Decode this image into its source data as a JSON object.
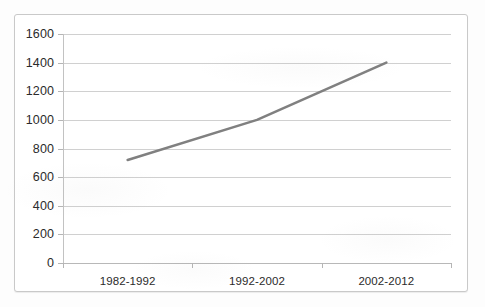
{
  "chart_data": {
    "type": "line",
    "title": "",
    "subtitle": "",
    "xlabel": "",
    "ylabel": "",
    "categories": [
      "1982-1992",
      "1992-2002",
      "2002-2012"
    ],
    "series": [
      {
        "name": "",
        "values": [
          720,
          1000,
          1400
        ],
        "color": "#808080"
      }
    ],
    "ylim": [
      0,
      1600
    ],
    "ytick_step": 200,
    "ytick_labels": [
      "0",
      "200",
      "400",
      "600",
      "800",
      "1000",
      "1200",
      "1400",
      "1600"
    ],
    "ytick_values": [
      0,
      200,
      400,
      600,
      800,
      1000,
      1200,
      1400,
      1600
    ],
    "grid": "horizontal",
    "legend": "none",
    "annotations": []
  },
  "style": {
    "line_color": "#808080",
    "gridline_color": "#d0d0d0",
    "axis_color": "#b8b8b8",
    "frame_color": "#c9c9c9",
    "text_color": "#2b2b2b",
    "plot_background": "#ffffff"
  }
}
